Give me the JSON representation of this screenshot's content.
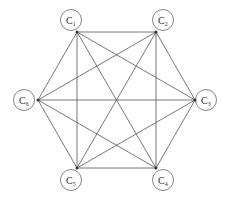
{
  "diagram": {
    "type": "complete-graph",
    "nodes": [
      {
        "id": "C1",
        "label": "C",
        "sub": "1",
        "cx": 71,
        "cy": 20,
        "px": 77,
        "py": 32
      },
      {
        "id": "C2",
        "label": "C",
        "sub": "2",
        "cx": 163,
        "cy": 20,
        "px": 156,
        "py": 32
      },
      {
        "id": "C3",
        "label": "C",
        "sub": "3",
        "cx": 206,
        "cy": 100,
        "px": 195,
        "py": 100
      },
      {
        "id": "C4",
        "label": "C",
        "sub": "4",
        "cx": 163,
        "cy": 180,
        "px": 156,
        "py": 168
      },
      {
        "id": "C5",
        "label": "C",
        "sub": "5",
        "cx": 71,
        "cy": 180,
        "px": 77,
        "py": 168
      },
      {
        "id": "C6",
        "label": "C",
        "sub": "6",
        "cx": 24,
        "cy": 100,
        "px": 38,
        "py": 100
      }
    ],
    "edges": [
      [
        "C1",
        "C2"
      ],
      [
        "C1",
        "C3"
      ],
      [
        "C1",
        "C4"
      ],
      [
        "C1",
        "C5"
      ],
      [
        "C1",
        "C6"
      ],
      [
        "C2",
        "C3"
      ],
      [
        "C2",
        "C4"
      ],
      [
        "C2",
        "C5"
      ],
      [
        "C2",
        "C6"
      ],
      [
        "C3",
        "C4"
      ],
      [
        "C3",
        "C5"
      ],
      [
        "C3",
        "C6"
      ],
      [
        "C4",
        "C5"
      ],
      [
        "C4",
        "C6"
      ],
      [
        "C5",
        "C6"
      ]
    ],
    "colors": {
      "edge": "#555555",
      "circle": "#777777",
      "text": "#333333"
    }
  }
}
